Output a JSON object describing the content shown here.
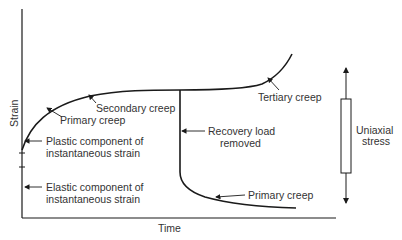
{
  "diagram": {
    "axes": {
      "x_label": "Time",
      "y_label": "Strain"
    },
    "annotations": {
      "primary_creep_upper": "Primary creep",
      "secondary_creep": "Secondary creep",
      "tertiary_creep": "Tertiary creep",
      "recovery_line1": "Recovery load",
      "recovery_line2": "removed",
      "primary_creep_lower": "Primary creep",
      "plastic_line1": "Plastic component of",
      "plastic_line2": "instantaneous strain",
      "elastic_line1": "Elastic component of",
      "elastic_line2": "instantaneous strain"
    },
    "specimen": {
      "label_line1": "Uniaxial",
      "label_line2": "stress"
    },
    "colors": {
      "line": "#1a1a1a",
      "text": "#333333",
      "background": "#ffffff"
    }
  }
}
